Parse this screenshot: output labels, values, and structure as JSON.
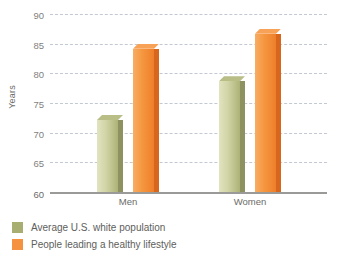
{
  "chart_data": {
    "type": "bar",
    "title": "",
    "xlabel": "",
    "ylabel": "Years",
    "categories": [
      "Men",
      "Women"
    ],
    "series": [
      {
        "name": "Average U.S. white population",
        "color": "#a8ae72",
        "values": [
          73,
          79.5
        ]
      },
      {
        "name": "People leading a healthy lifestyle",
        "color": "#f4923f",
        "values": [
          85,
          87.5
        ]
      }
    ],
    "ylim": [
      60,
      90
    ],
    "yticks": [
      60,
      65,
      70,
      75,
      80,
      85,
      90
    ],
    "ytick_labels": [
      "60",
      "65",
      "70",
      "75",
      "80",
      "85",
      "90"
    ],
    "grid": true,
    "grid_style": "dashed-horizontal",
    "legend_position": "bottom-left"
  },
  "axes": {
    "y_title": "Years"
  },
  "legend": {
    "items": [
      {
        "label": "Average U.S. white population",
        "color": "#a8ae72"
      },
      {
        "label": "People leading a healthy lifestyle",
        "color": "#f4923f"
      }
    ]
  }
}
